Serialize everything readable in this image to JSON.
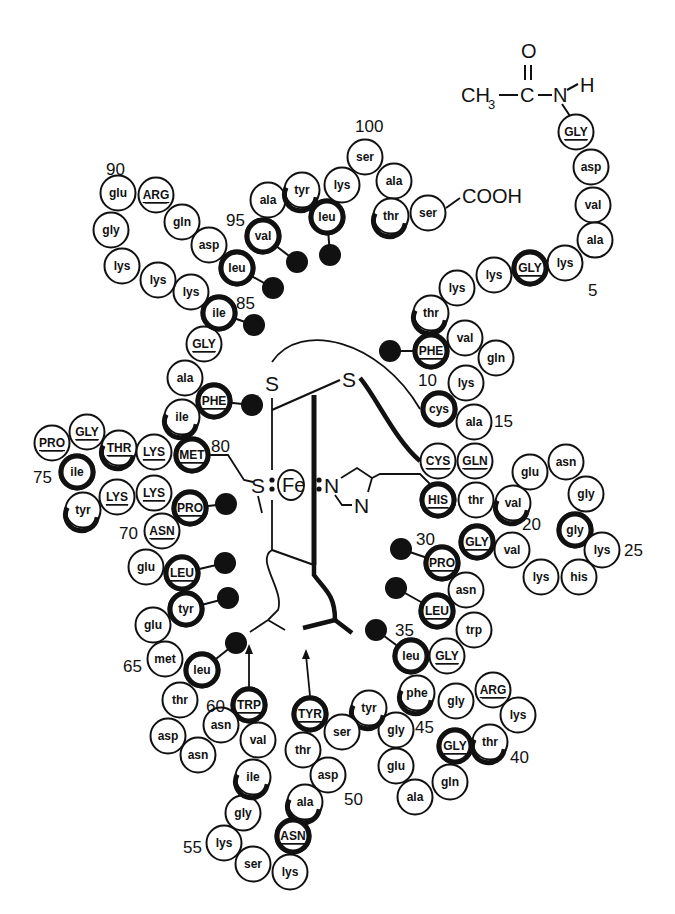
{
  "diagram": {
    "title": "",
    "n_terminus": {
      "label_ch3": "CH",
      "label_sub": "3",
      "label_c": "C",
      "label_o": "O",
      "label_n": "N",
      "label_h": "H"
    },
    "c_terminus": {
      "label": "COOH"
    },
    "heme": {
      "iron": "Fe",
      "sulfur_left": "S",
      "sulfur_top_left": "S",
      "sulfur_top_right": "S",
      "nitrogen_1": "N",
      "nitrogen_2": "N"
    },
    "residue_numbers": [
      {
        "label": "5",
        "x": 588,
        "y": 296
      },
      {
        "label": "10",
        "x": 418,
        "y": 386
      },
      {
        "label": "15",
        "x": 494,
        "y": 427
      },
      {
        "label": "20",
        "x": 522,
        "y": 530
      },
      {
        "label": "25",
        "x": 624,
        "y": 556
      },
      {
        "label": "30",
        "x": 416,
        "y": 545
      },
      {
        "label": "35",
        "x": 395,
        "y": 636
      },
      {
        "label": "40",
        "x": 510,
        "y": 763
      },
      {
        "label": "45",
        "x": 415,
        "y": 733
      },
      {
        "label": "50",
        "x": 344,
        "y": 805
      },
      {
        "label": "55",
        "x": 183,
        "y": 853
      },
      {
        "label": "60",
        "x": 206,
        "y": 712
      },
      {
        "label": "65",
        "x": 123,
        "y": 672
      },
      {
        "label": "70",
        "x": 119,
        "y": 539
      },
      {
        "label": "75",
        "x": 33,
        "y": 483
      },
      {
        "label": "80",
        "x": 211,
        "y": 452
      },
      {
        "label": "85",
        "x": 236,
        "y": 309
      },
      {
        "label": "90",
        "x": 106,
        "y": 175
      },
      {
        "label": "95",
        "x": 226,
        "y": 226
      },
      {
        "label": "100",
        "x": 355,
        "y": 132
      }
    ],
    "residues": [
      {
        "n": 1,
        "name": "GLY",
        "invariant": true,
        "x": 576,
        "y": 132,
        "ring": "none"
      },
      {
        "n": 2,
        "name": "asp",
        "invariant": false,
        "x": 591,
        "y": 167,
        "ring": "none"
      },
      {
        "n": 3,
        "name": "val",
        "invariant": false,
        "x": 593,
        "y": 205,
        "ring": "none"
      },
      {
        "n": 4,
        "name": "ala",
        "invariant": false,
        "x": 595,
        "y": 240,
        "ring": "none"
      },
      {
        "n": 5,
        "name": "lys",
        "invariant": false,
        "x": 565,
        "y": 263,
        "ring": "none"
      },
      {
        "n": 6,
        "name": "GLY",
        "invariant": true,
        "x": 530,
        "y": 268,
        "ring": "full"
      },
      {
        "n": 7,
        "name": "lys",
        "invariant": false,
        "x": 494,
        "y": 275,
        "ring": "none"
      },
      {
        "n": 8,
        "name": "lys",
        "invariant": false,
        "x": 457,
        "y": 288,
        "ring": "none"
      },
      {
        "n": 9,
        "name": "thr",
        "invariant": false,
        "x": 431,
        "y": 313,
        "ring": "partial"
      },
      {
        "n": 10,
        "name": "PHE",
        "invariant": true,
        "x": 431,
        "y": 351,
        "ring": "full",
        "side": {
          "x": 390,
          "y": 351
        }
      },
      {
        "n": 11,
        "name": "val",
        "invariant": false,
        "x": 465,
        "y": 338,
        "ring": "none"
      },
      {
        "n": 12,
        "name": "gln",
        "invariant": false,
        "x": 496,
        "y": 358,
        "ring": "none"
      },
      {
        "n": 13,
        "name": "lys",
        "invariant": false,
        "x": 466,
        "y": 383,
        "ring": "none"
      },
      {
        "n": 14,
        "name": "cys",
        "invariant": false,
        "x": 439,
        "y": 409,
        "ring": "full"
      },
      {
        "n": 15,
        "name": "ala",
        "invariant": false,
        "x": 474,
        "y": 422,
        "ring": "none"
      },
      {
        "n": 16,
        "name": "GLN",
        "invariant": true,
        "x": 475,
        "y": 461,
        "ring": "none"
      },
      {
        "n": 17,
        "name": "CYS",
        "invariant": true,
        "x": 438,
        "y": 461,
        "ring": "none"
      },
      {
        "n": 18,
        "name": "HIS",
        "invariant": true,
        "x": 438,
        "y": 500,
        "ring": "full"
      },
      {
        "n": 19,
        "name": "thr",
        "invariant": false,
        "x": 476,
        "y": 500,
        "ring": "none"
      },
      {
        "n": 20,
        "name": "val",
        "invariant": false,
        "x": 513,
        "y": 503,
        "ring": "partial"
      },
      {
        "n": 21,
        "name": "glu",
        "invariant": false,
        "x": 530,
        "y": 472,
        "ring": "none"
      },
      {
        "n": 22,
        "name": "asn",
        "invariant": false,
        "x": 566,
        "y": 462,
        "ring": "none"
      },
      {
        "n": 23,
        "name": "gly",
        "invariant": false,
        "x": 586,
        "y": 494,
        "ring": "none"
      },
      {
        "n": 24,
        "name": "gly",
        "invariant": false,
        "x": 575,
        "y": 530,
        "ring": "full"
      },
      {
        "n": 25,
        "name": "lys",
        "invariant": false,
        "x": 602,
        "y": 550,
        "ring": "none"
      },
      {
        "n": 26,
        "name": "his",
        "invariant": false,
        "x": 579,
        "y": 577,
        "ring": "none"
      },
      {
        "n": 27,
        "name": "lys",
        "invariant": false,
        "x": 541,
        "y": 577,
        "ring": "none"
      },
      {
        "n": 28,
        "name": "val",
        "invariant": false,
        "x": 512,
        "y": 550,
        "ring": "none"
      },
      {
        "n": 29,
        "name": "GLY",
        "invariant": true,
        "x": 477,
        "y": 542,
        "ring": "full"
      },
      {
        "n": 30,
        "name": "PRO",
        "invariant": true,
        "x": 442,
        "y": 563,
        "ring": "full",
        "side": {
          "x": 401,
          "y": 549
        }
      },
      {
        "n": 31,
        "name": "asn",
        "invariant": false,
        "x": 466,
        "y": 590,
        "ring": "none"
      },
      {
        "n": 32,
        "name": "LEU",
        "invariant": true,
        "x": 437,
        "y": 611,
        "ring": "full",
        "side": {
          "x": 396,
          "y": 588
        }
      },
      {
        "n": 33,
        "name": "trp",
        "invariant": false,
        "x": 474,
        "y": 630,
        "ring": "none"
      },
      {
        "n": 34,
        "name": "GLY",
        "invariant": true,
        "x": 447,
        "y": 656,
        "ring": "none"
      },
      {
        "n": 35,
        "name": "leu",
        "invariant": false,
        "x": 411,
        "y": 656,
        "ring": "full",
        "side": {
          "x": 376,
          "y": 630
        }
      },
      {
        "n": 36,
        "name": "phe",
        "invariant": false,
        "x": 417,
        "y": 693,
        "ring": "partial"
      },
      {
        "n": 37,
        "name": "gly",
        "invariant": false,
        "x": 456,
        "y": 701,
        "ring": "none"
      },
      {
        "n": 38,
        "name": "ARG",
        "invariant": true,
        "x": 493,
        "y": 690,
        "ring": "none"
      },
      {
        "n": 39,
        "name": "lys",
        "invariant": false,
        "x": 518,
        "y": 715,
        "ring": "none"
      },
      {
        "n": 40,
        "name": "thr",
        "invariant": false,
        "x": 490,
        "y": 742,
        "ring": "partial"
      },
      {
        "n": 41,
        "name": "GLY",
        "invariant": true,
        "x": 455,
        "y": 746,
        "ring": "full"
      },
      {
        "n": 42,
        "name": "gln",
        "invariant": false,
        "x": 450,
        "y": 782,
        "ring": "none"
      },
      {
        "n": 43,
        "name": "ala",
        "invariant": false,
        "x": 415,
        "y": 797,
        "ring": "none"
      },
      {
        "n": 44,
        "name": "glu",
        "invariant": false,
        "x": 396,
        "y": 766,
        "ring": "none"
      },
      {
        "n": 45,
        "name": "gly",
        "invariant": false,
        "x": 396,
        "y": 730,
        "ring": "none"
      },
      {
        "n": 46,
        "name": "tyr",
        "invariant": false,
        "x": 369,
        "y": 708,
        "ring": "partial"
      },
      {
        "n": 47,
        "name": "ser",
        "invariant": false,
        "x": 342,
        "y": 732,
        "ring": "none"
      },
      {
        "n": 48,
        "name": "TYR",
        "invariant": true,
        "x": 310,
        "y": 714,
        "ring": "full"
      },
      {
        "n": 49,
        "name": "thr",
        "invariant": false,
        "x": 303,
        "y": 750,
        "ring": "none"
      },
      {
        "n": 50,
        "name": "asp",
        "invariant": false,
        "x": 328,
        "y": 775,
        "ring": "none"
      },
      {
        "n": 51,
        "name": "ala",
        "invariant": false,
        "x": 305,
        "y": 802,
        "ring": "partial"
      },
      {
        "n": 52,
        "name": "ASN",
        "invariant": true,
        "x": 293,
        "y": 836,
        "ring": "full"
      },
      {
        "n": 53,
        "name": "lys",
        "invariant": false,
        "x": 290,
        "y": 872,
        "ring": "none"
      },
      {
        "n": 54,
        "name": "ser",
        "invariant": false,
        "x": 253,
        "y": 864,
        "ring": "none"
      },
      {
        "n": 55,
        "name": "lys",
        "invariant": false,
        "x": 224,
        "y": 843,
        "ring": "none"
      },
      {
        "n": 56,
        "name": "gly",
        "invariant": false,
        "x": 243,
        "y": 813,
        "ring": "none"
      },
      {
        "n": 57,
        "name": "ile",
        "invariant": false,
        "x": 253,
        "y": 777,
        "ring": "partial"
      },
      {
        "n": 58,
        "name": "val",
        "invariant": false,
        "x": 258,
        "y": 740,
        "ring": "none"
      },
      {
        "n": 59,
        "name": "TRP",
        "invariant": true,
        "x": 249,
        "y": 705,
        "ring": "full"
      },
      {
        "n": 60,
        "name": "asn",
        "invariant": false,
        "x": 221,
        "y": 725,
        "ring": "none"
      },
      {
        "n": 61,
        "name": "asn",
        "invariant": false,
        "x": 198,
        "y": 755,
        "ring": "none"
      },
      {
        "n": 62,
        "name": "asp",
        "invariant": false,
        "x": 168,
        "y": 736,
        "ring": "none"
      },
      {
        "n": 63,
        "name": "thr",
        "invariant": false,
        "x": 180,
        "y": 700,
        "ring": "none"
      },
      {
        "n": 64,
        "name": "leu",
        "invariant": false,
        "x": 202,
        "y": 670,
        "ring": "full",
        "side": {
          "x": 236,
          "y": 643
        }
      },
      {
        "n": 65,
        "name": "met",
        "invariant": false,
        "x": 165,
        "y": 659,
        "ring": "none"
      },
      {
        "n": 66,
        "name": "glu",
        "invariant": false,
        "x": 153,
        "y": 625,
        "ring": "none"
      },
      {
        "n": 67,
        "name": "tyr",
        "invariant": false,
        "x": 186,
        "y": 609,
        "ring": "full",
        "side": {
          "x": 228,
          "y": 598
        }
      },
      {
        "n": 68,
        "name": "LEU",
        "invariant": true,
        "x": 182,
        "y": 573,
        "ring": "full",
        "side": {
          "x": 225,
          "y": 563
        }
      },
      {
        "n": 69,
        "name": "glu",
        "invariant": false,
        "x": 146,
        "y": 567,
        "ring": "none"
      },
      {
        "n": 70,
        "name": "ASN",
        "invariant": true,
        "x": 162,
        "y": 531,
        "ring": "none"
      },
      {
        "n": 71,
        "name": "PRO",
        "invariant": true,
        "x": 190,
        "y": 508,
        "ring": "full",
        "side": {
          "x": 226,
          "y": 504
        }
      },
      {
        "n": 72,
        "name": "LYS",
        "invariant": true,
        "x": 154,
        "y": 493,
        "ring": "none"
      },
      {
        "n": 73,
        "name": "LYS",
        "invariant": true,
        "x": 117,
        "y": 497,
        "ring": "none"
      },
      {
        "n": 74,
        "name": "tyr",
        "invariant": false,
        "x": 83,
        "y": 510,
        "ring": "partial"
      },
      {
        "n": 75,
        "name": "ile",
        "invariant": false,
        "x": 77,
        "y": 472,
        "ring": "full"
      },
      {
        "n": 76,
        "name": "PRO",
        "invariant": true,
        "x": 52,
        "y": 443,
        "ring": "none"
      },
      {
        "n": 77,
        "name": "GLY",
        "invariant": true,
        "x": 87,
        "y": 432,
        "ring": "none"
      },
      {
        "n": 78,
        "name": "THR",
        "invariant": true,
        "x": 119,
        "y": 448,
        "ring": "partial"
      },
      {
        "n": 79,
        "name": "LYS",
        "invariant": true,
        "x": 154,
        "y": 452,
        "ring": "none"
      },
      {
        "n": 80,
        "name": "MET",
        "invariant": true,
        "x": 192,
        "y": 455,
        "ring": "full"
      },
      {
        "n": 81,
        "name": "ile",
        "invariant": false,
        "x": 182,
        "y": 417,
        "ring": "partial"
      },
      {
        "n": 82,
        "name": "PHE",
        "invariant": true,
        "x": 214,
        "y": 401,
        "ring": "full",
        "side": {
          "x": 252,
          "y": 405
        }
      },
      {
        "n": 83,
        "name": "ala",
        "invariant": false,
        "x": 185,
        "y": 378,
        "ring": "none"
      },
      {
        "n": 84,
        "name": "GLY",
        "invariant": true,
        "x": 204,
        "y": 344,
        "ring": "none"
      },
      {
        "n": 85,
        "name": "ile",
        "invariant": false,
        "x": 219,
        "y": 313,
        "ring": "full",
        "side": {
          "x": 254,
          "y": 325
        }
      },
      {
        "n": 86,
        "name": "lys",
        "invariant": false,
        "x": 191,
        "y": 292,
        "ring": "none"
      },
      {
        "n": 87,
        "name": "lys",
        "invariant": false,
        "x": 158,
        "y": 280,
        "ring": "none"
      },
      {
        "n": 88,
        "name": "lys",
        "invariant": false,
        "x": 122,
        "y": 266,
        "ring": "none"
      },
      {
        "n": 89,
        "name": "gly",
        "invariant": false,
        "x": 111,
        "y": 230,
        "ring": "none"
      },
      {
        "n": 90,
        "name": "glu",
        "invariant": false,
        "x": 118,
        "y": 193,
        "ring": "none"
      },
      {
        "n": 91,
        "name": "ARG",
        "invariant": true,
        "x": 156,
        "y": 195,
        "ring": "none"
      },
      {
        "n": 92,
        "name": "gln",
        "invariant": false,
        "x": 182,
        "y": 222,
        "ring": "none"
      },
      {
        "n": 93,
        "name": "asp",
        "invariant": false,
        "x": 209,
        "y": 245,
        "ring": "none"
      },
      {
        "n": 94,
        "name": "leu",
        "invariant": false,
        "x": 237,
        "y": 268,
        "ring": "full",
        "side": {
          "x": 273,
          "y": 288
        }
      },
      {
        "n": 95,
        "name": "val",
        "invariant": false,
        "x": 263,
        "y": 236,
        "ring": "full",
        "side": {
          "x": 297,
          "y": 262
        }
      },
      {
        "n": 96,
        "name": "ala",
        "invariant": false,
        "x": 268,
        "y": 200,
        "ring": "none"
      },
      {
        "n": 97,
        "name": "tyr",
        "invariant": false,
        "x": 302,
        "y": 190,
        "ring": "partial"
      },
      {
        "n": 98,
        "name": "leu",
        "invariant": false,
        "x": 327,
        "y": 217,
        "ring": "full",
        "side": {
          "x": 330,
          "y": 255
        }
      },
      {
        "n": 99,
        "name": "lys",
        "invariant": false,
        "x": 342,
        "y": 185,
        "ring": "none"
      },
      {
        "n": 100,
        "name": "ser",
        "invariant": false,
        "x": 365,
        "y": 157,
        "ring": "none"
      },
      {
        "n": 101,
        "name": "ala",
        "invariant": false,
        "x": 394,
        "y": 181,
        "ring": "none"
      },
      {
        "n": 102,
        "name": "thr",
        "invariant": false,
        "x": 391,
        "y": 216,
        "ring": "partial"
      },
      {
        "n": 103,
        "name": "ser",
        "invariant": false,
        "x": 428,
        "y": 213,
        "ring": "none"
      }
    ]
  }
}
